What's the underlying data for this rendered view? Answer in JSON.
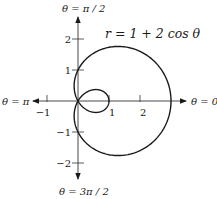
{
  "chart_data": {
    "type": "line",
    "subtype": "polar",
    "title": "",
    "equation_label": "r = 1 + 2 cos θ",
    "equation": {
      "a": 1,
      "b": 2,
      "func": "cos"
    },
    "theta_range": [
      0,
      6.283185307
    ],
    "axis_labels": {
      "right": "θ = 0",
      "top": "θ = π / 2",
      "left": "θ = π",
      "bottom": "θ = 3π / 2"
    },
    "x_ticks": [
      {
        "value": -1,
        "label": "−1"
      },
      {
        "value": 1,
        "label": "1"
      },
      {
        "value": 2,
        "label": "2"
      }
    ],
    "y_ticks": [
      {
        "value": 2,
        "label": "2"
      },
      {
        "value": 1,
        "label": "1"
      },
      {
        "value": -1,
        "label": "−1"
      },
      {
        "value": -2,
        "label": "−2"
      }
    ],
    "xlim": [
      -1.4,
      3.5
    ],
    "ylim": [
      -2.5,
      2.2
    ],
    "grid": false,
    "legend": "none",
    "key_points": [
      {
        "theta": "0",
        "r": 3
      },
      {
        "theta": "π/2",
        "r": 1
      },
      {
        "theta": "2π/3",
        "r": 0
      },
      {
        "theta": "π",
        "r": -1
      },
      {
        "theta": "3π/2",
        "r": 1
      }
    ],
    "colors": {
      "curve": "#1a1a1a",
      "axes": "#333333"
    }
  },
  "layout": {
    "origin_x": 78,
    "origin_y": 101,
    "scale": 31
  }
}
